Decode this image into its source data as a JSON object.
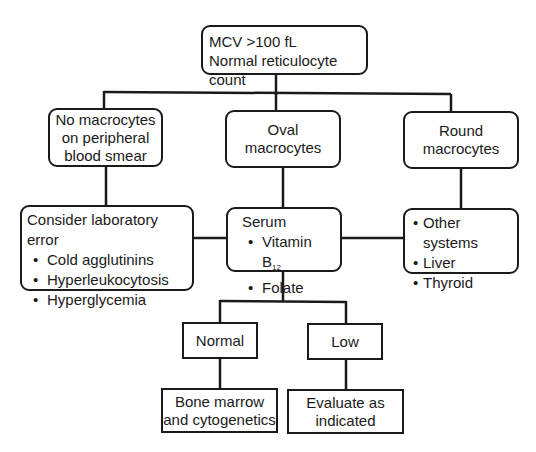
{
  "diagram": {
    "type": "flowchart",
    "root": {
      "line1": "MCV >100 fL",
      "line2": "Normal reticulocyte count"
    },
    "level1": [
      {
        "id": "no-macrocytes",
        "lines": [
          "No macrocytes",
          "on peripheral",
          "blood smear"
        ]
      },
      {
        "id": "oval-macrocytes",
        "lines": [
          "Oval",
          "macrocytes"
        ]
      },
      {
        "id": "round-macrocytes",
        "lines": [
          "Round",
          "macrocytes"
        ]
      }
    ],
    "level2": {
      "lab_error": {
        "title": "Consider laboratory error",
        "items": [
          "Cold agglutinins",
          "Hyperleukocytosis",
          "Hyperglycemia"
        ]
      },
      "serum": {
        "title": "Serum",
        "items": [
          "Vitamin B",
          "Folate"
        ],
        "b12_subscript": "12"
      },
      "other": {
        "items": [
          "Other systems",
          "Liver",
          "Thyroid"
        ]
      }
    },
    "level3": [
      {
        "id": "normal",
        "label": "Normal"
      },
      {
        "id": "low",
        "label": "Low"
      }
    ],
    "level4": [
      {
        "id": "bone-marrow",
        "lines": [
          "Bone marrow",
          "and cytogenetics"
        ]
      },
      {
        "id": "evaluate",
        "lines": [
          "Evaluate as",
          "indicated"
        ]
      }
    ],
    "edges": [
      [
        "root",
        "no-macrocytes"
      ],
      [
        "root",
        "oval-macrocytes"
      ],
      [
        "root",
        "round-macrocytes"
      ],
      [
        "no-macrocytes",
        "lab_error"
      ],
      [
        "oval-macrocytes",
        "serum"
      ],
      [
        "round-macrocytes",
        "other"
      ],
      [
        "lab_error",
        "serum"
      ],
      [
        "serum",
        "other"
      ],
      [
        "serum",
        "normal"
      ],
      [
        "serum",
        "low"
      ],
      [
        "normal",
        "bone-marrow"
      ],
      [
        "low",
        "evaluate"
      ]
    ],
    "colors": {
      "stroke": "#1a1a1a",
      "background": "#ffffff"
    }
  }
}
